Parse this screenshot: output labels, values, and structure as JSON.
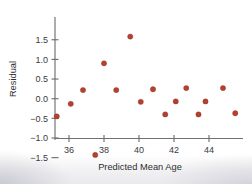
{
  "chart_data": {
    "type": "scatter",
    "title": "",
    "subtitle": "",
    "xlabel": "Predicted Mean Age",
    "ylabel": "Residual",
    "xlim": [
      35.0,
      45.9
    ],
    "ylim": [
      -1.62,
      1.72
    ],
    "xticks": [
      36,
      38,
      40,
      42,
      44
    ],
    "xtick_labels": [
      "36",
      "38",
      "40",
      "42",
      "44"
    ],
    "yticks": [
      -1.5,
      -1.0,
      -0.5,
      0.0,
      0.5,
      1.0,
      1.5
    ],
    "ytick_labels": [
      "−1.5",
      "−1.0",
      "−0.5",
      "0.0",
      "0.5",
      "1.0",
      "1.5"
    ],
    "grid": false,
    "legend": null,
    "series": [
      {
        "name": "Residuals",
        "marker": "circle",
        "color": "#b4402f",
        "points": [
          {
            "x": 35.3,
            "y": -0.45
          },
          {
            "x": 36.1,
            "y": -0.13
          },
          {
            "x": 36.8,
            "y": 0.22
          },
          {
            "x": 37.5,
            "y": -1.43
          },
          {
            "x": 38.0,
            "y": 0.9
          },
          {
            "x": 38.7,
            "y": 0.22
          },
          {
            "x": 39.5,
            "y": 1.58
          },
          {
            "x": 40.1,
            "y": -0.08
          },
          {
            "x": 40.8,
            "y": 0.24
          },
          {
            "x": 41.5,
            "y": -0.4
          },
          {
            "x": 42.1,
            "y": -0.07
          },
          {
            "x": 42.7,
            "y": 0.27
          },
          {
            "x": 43.4,
            "y": -0.4
          },
          {
            "x": 43.8,
            "y": -0.07
          },
          {
            "x": 44.8,
            "y": 0.27
          },
          {
            "x": 45.5,
            "y": -0.37
          }
        ]
      }
    ]
  },
  "colors": {
    "marker": "#b4402f",
    "axis": "#6f7073",
    "text": "#2e2e30",
    "background": "#ffffff"
  }
}
